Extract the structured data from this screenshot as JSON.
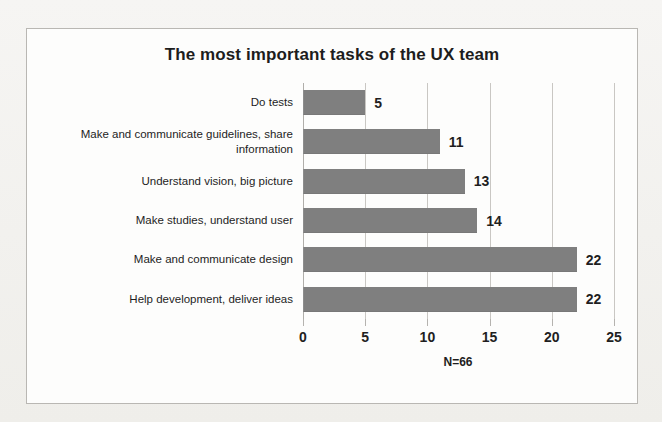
{
  "chart_data": {
    "type": "bar",
    "orientation": "horizontal",
    "title": "The most important tasks of the UX team",
    "xlabel": "",
    "ylabel": "",
    "xlim": [
      0,
      25
    ],
    "xticks": [
      0,
      5,
      10,
      15,
      20,
      25
    ],
    "grid": true,
    "legend": null,
    "annotation": "N=66",
    "bar_color": "#7f7f7f",
    "categories": [
      "Do tests",
      "Make and communicate guidelines, share information",
      "Understand vision, big picture",
      "Make studies, understand user",
      "Make and communicate design",
      "Help development, deliver ideas"
    ],
    "values": [
      5,
      11,
      13,
      14,
      22,
      22
    ],
    "bars": [
      {
        "label": "Do tests",
        "value": 5,
        "value_text": "5"
      },
      {
        "label": "Make and communicate guidelines, share information",
        "value": 11,
        "value_text": "11"
      },
      {
        "label": "Understand vision, big picture",
        "value": 13,
        "value_text": "13"
      },
      {
        "label": "Make studies, understand user",
        "value": 14,
        "value_text": "14"
      },
      {
        "label": "Make and communicate design",
        "value": 22,
        "value_text": "22"
      },
      {
        "label": "Help development, deliver ideas",
        "value": 22,
        "value_text": "22"
      }
    ],
    "xtick_labels": [
      "0",
      "5",
      "10",
      "15",
      "20",
      "25"
    ]
  }
}
